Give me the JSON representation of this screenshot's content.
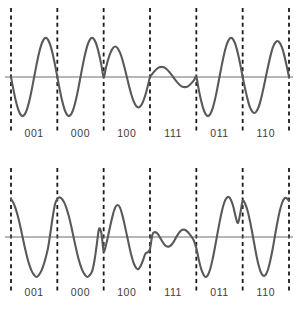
{
  "figure": {
    "kind": "waveform-diagram",
    "colors": {
      "waveform": "#595959",
      "axis": "#6e6e6e",
      "boundary": "#1a1a1a",
      "label": "#3b3b3b",
      "background": "#ffffff"
    }
  },
  "chart_data": [
    {
      "type": "line",
      "name": "top-waveform",
      "title": "",
      "xlabel": "",
      "ylabel": "",
      "grid": false,
      "legend": null,
      "xlim": [
        0,
        6
      ],
      "ylim": [
        -1.15,
        1.15
      ],
      "zero_axis": true,
      "segment_boundaries": [
        0,
        1,
        2,
        3,
        4,
        5,
        6
      ],
      "categories": [
        "001",
        "000",
        "100",
        "111",
        "011",
        "110"
      ],
      "segment_amplitudes": [
        1.0,
        1.0,
        0.78,
        0.26,
        1.0,
        0.92
      ],
      "segment_start_phase_deg": [
        180,
        180,
        0,
        0,
        180,
        180
      ],
      "cycles_per_segment": 1,
      "x": [
        0.0,
        0.05,
        0.1,
        0.15,
        0.2,
        0.25,
        0.3,
        0.35,
        0.4,
        0.45,
        0.5,
        0.55,
        0.6,
        0.65,
        0.7,
        0.75,
        0.8,
        0.85,
        0.9,
        0.95,
        1.0,
        1.05,
        1.1,
        1.15,
        1.2,
        1.25,
        1.3,
        1.35,
        1.4,
        1.45,
        1.5,
        1.55,
        1.6,
        1.65,
        1.7,
        1.75,
        1.8,
        1.85,
        1.9,
        1.95,
        2.0,
        2.05,
        2.1,
        2.15,
        2.2,
        2.25,
        2.3,
        2.35,
        2.4,
        2.45,
        2.5,
        2.55,
        2.6,
        2.65,
        2.7,
        2.75,
        2.8,
        2.85,
        2.9,
        2.95,
        3.0,
        3.05,
        3.1,
        3.15,
        3.2,
        3.25,
        3.3,
        3.35,
        3.4,
        3.45,
        3.5,
        3.55,
        3.6,
        3.65,
        3.7,
        3.75,
        3.8,
        3.85,
        3.9,
        3.95,
        4.0,
        4.05,
        4.1,
        4.15,
        4.2,
        4.25,
        4.3,
        4.35,
        4.4,
        4.45,
        4.5,
        4.55,
        4.6,
        4.65,
        4.7,
        4.75,
        4.8,
        4.85,
        4.9,
        4.95,
        5.0,
        5.05,
        5.1,
        5.15,
        5.2,
        5.25,
        5.3,
        5.35,
        5.4,
        5.45,
        5.5,
        5.55,
        5.6,
        5.65,
        5.7,
        5.75,
        5.8,
        5.85,
        5.9,
        5.95,
        6.0
      ],
      "y": [
        0.0,
        -0.31,
        -0.59,
        -0.81,
        -0.95,
        -1.0,
        -0.95,
        -0.81,
        -0.59,
        -0.31,
        0.0,
        0.31,
        0.59,
        0.81,
        0.95,
        1.0,
        0.95,
        0.81,
        0.59,
        0.31,
        0.0,
        -0.31,
        -0.59,
        -0.81,
        -0.95,
        -1.0,
        -0.95,
        -0.81,
        -0.59,
        -0.31,
        0.0,
        0.31,
        0.59,
        0.81,
        0.95,
        1.0,
        0.95,
        0.81,
        0.59,
        0.31,
        0.0,
        0.24,
        0.46,
        0.63,
        0.74,
        0.78,
        0.74,
        0.63,
        0.46,
        0.24,
        0.0,
        -0.24,
        -0.46,
        -0.63,
        -0.74,
        -0.78,
        -0.74,
        -0.63,
        -0.46,
        -0.24,
        0.0,
        0.08,
        0.15,
        0.21,
        0.25,
        0.26,
        0.25,
        0.21,
        0.15,
        0.08,
        0.0,
        -0.08,
        -0.15,
        -0.21,
        -0.25,
        -0.26,
        -0.25,
        -0.21,
        -0.15,
        -0.08,
        0.0,
        -0.31,
        -0.59,
        -0.81,
        -0.95,
        -1.0,
        -0.95,
        -0.81,
        -0.59,
        -0.31,
        0.0,
        0.31,
        0.59,
        0.81,
        0.95,
        1.0,
        0.95,
        0.81,
        0.59,
        0.31,
        0.0,
        -0.28,
        -0.54,
        -0.75,
        -0.87,
        -0.92,
        -0.87,
        -0.75,
        -0.54,
        -0.28,
        0.0,
        0.28,
        0.54,
        0.75,
        0.87,
        0.92,
        0.87,
        0.75,
        0.54,
        0.28,
        0.0
      ]
    },
    {
      "type": "line",
      "name": "bottom-waveform",
      "title": "",
      "xlabel": "",
      "ylabel": "",
      "grid": false,
      "legend": null,
      "xlim": [
        0,
        6
      ],
      "ylim": [
        -1.15,
        1.15
      ],
      "zero_axis": true,
      "segment_boundaries": [
        0,
        1,
        2,
        3,
        4,
        5,
        6
      ],
      "categories": [
        "001",
        "000",
        "100",
        "111",
        "011",
        "110"
      ],
      "segment_amplitudes": [
        1.0,
        1.0,
        0.8,
        0.24,
        1.0,
        0.95
      ],
      "segment_start_phase_deg": [
        90,
        90,
        270,
        270,
        270,
        90
      ],
      "cycles_per_segment": 1,
      "x": [
        0.0,
        0.05,
        0.1,
        0.15,
        0.2,
        0.25,
        0.3,
        0.35,
        0.4,
        0.45,
        0.5,
        0.55,
        0.6,
        0.65,
        0.7,
        0.75,
        0.8,
        0.85,
        0.9,
        0.95,
        1.0,
        1.05,
        1.1,
        1.15,
        1.2,
        1.25,
        1.3,
        1.35,
        1.4,
        1.45,
        1.5,
        1.55,
        1.6,
        1.65,
        1.7,
        1.75,
        1.8,
        1.85,
        1.9,
        1.95,
        2.0,
        2.05,
        2.1,
        2.15,
        2.2,
        2.25,
        2.3,
        2.35,
        2.4,
        2.45,
        2.5,
        2.55,
        2.6,
        2.65,
        2.7,
        2.75,
        2.8,
        2.85,
        2.9,
        2.95,
        3.0,
        3.05,
        3.1,
        3.15,
        3.2,
        3.25,
        3.3,
        3.35,
        3.4,
        3.45,
        3.5,
        3.55,
        3.6,
        3.65,
        3.7,
        3.75,
        3.8,
        3.85,
        3.9,
        3.95,
        4.0,
        4.05,
        4.1,
        4.15,
        4.2,
        4.25,
        4.3,
        4.35,
        4.4,
        4.45,
        4.5,
        4.55,
        4.6,
        4.65,
        4.7,
        4.75,
        4.8,
        4.85,
        4.9,
        4.95,
        5.0,
        5.05,
        5.1,
        5.15,
        5.2,
        5.25,
        5.3,
        5.35,
        5.4,
        5.45,
        5.5,
        5.55,
        5.6,
        5.65,
        5.7,
        5.75,
        5.8,
        5.85,
        5.9,
        5.95,
        6.0
      ],
      "y": [
        0.95,
        0.86,
        0.71,
        0.51,
        0.27,
        0.0,
        -0.27,
        -0.51,
        -0.71,
        -0.86,
        -0.95,
        -1.0,
        -0.95,
        -0.86,
        -0.71,
        -0.51,
        -0.27,
        0.1,
        0.5,
        0.82,
        0.95,
        0.99,
        0.95,
        0.86,
        0.71,
        0.51,
        0.27,
        0.0,
        -0.27,
        -0.51,
        -0.71,
        -0.86,
        -0.95,
        -1.0,
        -0.95,
        -0.86,
        -0.6,
        -0.2,
        0.2,
        0.1,
        -0.35,
        -0.2,
        0.05,
        0.32,
        0.56,
        0.74,
        0.8,
        0.74,
        0.56,
        0.32,
        0.05,
        -0.22,
        -0.47,
        -0.66,
        -0.77,
        -0.8,
        -0.72,
        -0.58,
        -0.42,
        -0.38,
        -0.3,
        0.05,
        0.12,
        0.1,
        0.02,
        -0.08,
        -0.17,
        -0.23,
        -0.24,
        -0.21,
        -0.14,
        -0.04,
        0.06,
        0.14,
        0.18,
        0.18,
        0.14,
        0.08,
        0.0,
        -0.1,
        -0.28,
        -0.55,
        -0.78,
        -0.93,
        -1.0,
        -0.95,
        -0.8,
        -0.56,
        -0.27,
        0.05,
        0.36,
        0.64,
        0.85,
        0.97,
        1.0,
        0.92,
        0.75,
        0.5,
        0.35,
        0.6,
        0.9,
        0.84,
        0.68,
        0.44,
        0.15,
        -0.17,
        -0.48,
        -0.73,
        -0.9,
        -0.97,
        -0.94,
        -0.8,
        -0.57,
        -0.28,
        0.05,
        0.37,
        0.65,
        0.85,
        0.96,
        0.97,
        0.9
      ]
    }
  ],
  "panels": {
    "top": {
      "id": "top-waveform-panel",
      "labels": [
        "001",
        "000",
        "100",
        "111",
        "011",
        "110"
      ]
    },
    "bottom": {
      "id": "bottom-waveform-panel",
      "labels": [
        "001",
        "000",
        "100",
        "111",
        "011",
        "110"
      ]
    }
  }
}
